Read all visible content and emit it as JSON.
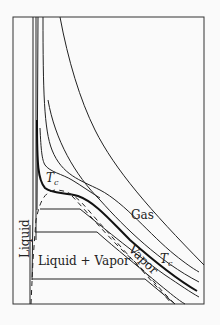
{
  "diagram": {
    "type": "pv-isotherms",
    "labels": {
      "liquid": "Liquid",
      "liquid_vapor": "Liquid + Vapor",
      "vapor": "Vapor",
      "gas": "Gas",
      "critical_point": "T",
      "critical_point_sub": "c",
      "critical_isotherm": "T",
      "critical_isotherm_sub": "c"
    },
    "colors": {
      "line": "#222222",
      "background": "#fafafa"
    }
  }
}
